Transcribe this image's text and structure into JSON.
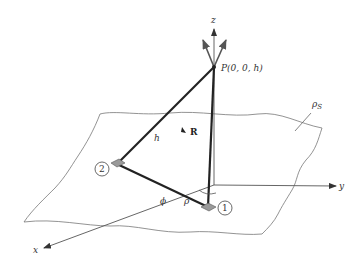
{
  "figure": {
    "type": "3d-geometry",
    "labels": {
      "z_axis": "z",
      "y_axis": "y",
      "x_axis": "x",
      "point_p": "P(0, 0, h)",
      "height": "h",
      "vector_r": "R",
      "surface_density": "ρ",
      "surface_density_sub": "S",
      "angle": "ϕ",
      "radius": "ρ",
      "antenna_1": "1",
      "antenna_2": "2"
    },
    "colors": {
      "thin_line": "#666666",
      "thick_line": "#222222",
      "surface": "#777777",
      "antenna_fill": "#9a9a9a"
    }
  }
}
